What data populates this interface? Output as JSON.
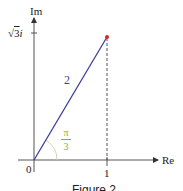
{
  "axes": {
    "x_label": "Re",
    "y_label": "Im",
    "origin_label": "0",
    "x_tick": "1",
    "y_tick_root": "3",
    "y_tick_suffix": "i"
  },
  "vector": {
    "length_label": "2",
    "color": "#3b3f9e",
    "point_color": "#d9262c"
  },
  "angle": {
    "numerator": "π",
    "denominator": "3",
    "color": "#7cb342"
  },
  "caption": "Figure 2"
}
